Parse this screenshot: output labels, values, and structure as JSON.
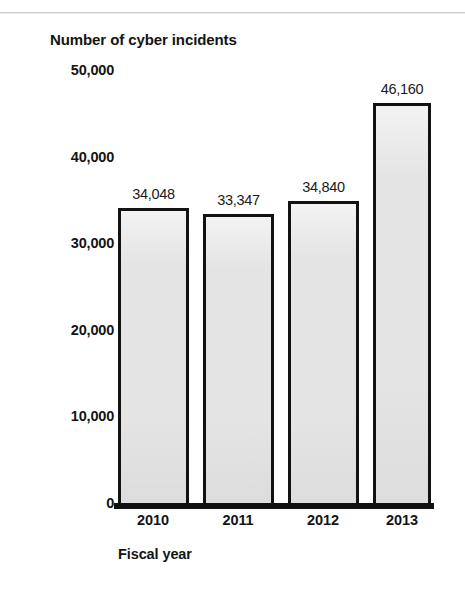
{
  "chart_data": {
    "type": "bar",
    "title": "Number of cyber incidents",
    "xlabel": "Fiscal year",
    "ylabel": "",
    "categories": [
      "2010",
      "2011",
      "2012",
      "2013"
    ],
    "values": [
      34048,
      33347,
      34840,
      46160
    ],
    "value_labels": [
      "34,048",
      "33,347",
      "34,840",
      "46,160"
    ],
    "ylim": [
      0,
      50000
    ],
    "yticks": [
      50000,
      40000,
      30000,
      20000,
      10000,
      0
    ],
    "ytick_labels": [
      "50,000",
      "40,000",
      "30,000",
      "20,000",
      "10,000",
      "0"
    ],
    "grid": false,
    "legend": null,
    "series": [
      {
        "name": "Number of cyber incidents",
        "values": [
          34048,
          33347,
          34840,
          46160
        ]
      }
    ],
    "colors": {
      "bar_fill": "#e4e4e4",
      "bar_border": "#121212",
      "axis": "#111111",
      "text": "#141414",
      "background": "#ffffff"
    }
  }
}
